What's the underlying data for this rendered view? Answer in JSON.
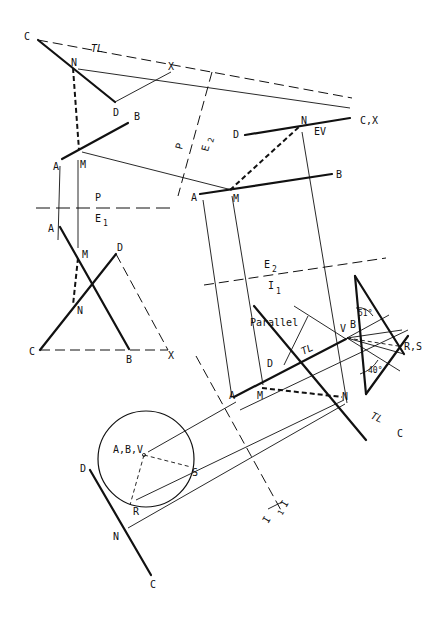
{
  "diagram": {
    "colors": {
      "ink": "#111111",
      "background": "#ffffff"
    },
    "reference_lines": [
      {
        "id": "P_E1",
        "top": "P",
        "bottom": "E",
        "bottom_sub": "1"
      },
      {
        "id": "P_E2",
        "top": "P",
        "bottom": "E",
        "bottom_sub": "2"
      },
      {
        "id": "E2_I1",
        "top": "E",
        "top_sub": "2",
        "bottom": "I",
        "bottom_sub": "1"
      },
      {
        "id": "I1_I2",
        "top": "I",
        "top_sub": "1",
        "bottom": "I",
        "bottom_sub": "2"
      }
    ],
    "views": {
      "profile": {
        "C": "C",
        "N": "N",
        "X": "X",
        "D": "D",
        "B": "B",
        "A": "A",
        "M": "M",
        "TL": "TL"
      },
      "front": {
        "A": "A",
        "M": "M",
        "D": "D",
        "N": "N",
        "C": "C",
        "B": "B",
        "X": "X"
      },
      "aux1": {
        "D": "D",
        "N": "N",
        "CX": "C,X",
        "EV": "EV",
        "A": "A",
        "M": "M",
        "B": "B"
      },
      "aux2": {
        "A": "A",
        "M": "M",
        "D": "D",
        "N": "N",
        "C": "C",
        "TL1": "TL",
        "TL2": "TL",
        "V": "V",
        "B": "B",
        "RS": "R,S",
        "parallel": "Parallel",
        "angle1": "51°",
        "angle2": "40°"
      },
      "point_view": {
        "ABV": "A,B,V",
        "S": "S",
        "R": "R",
        "D": "D",
        "N": "N",
        "C": "C"
      }
    }
  }
}
